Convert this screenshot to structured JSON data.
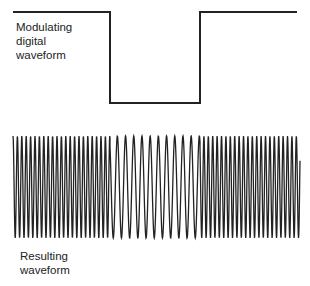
{
  "diagram": {
    "type": "frequency-shift-keying",
    "top_label": [
      "Modulating",
      "digital",
      "waveform"
    ],
    "bottom_label": [
      "Resulting",
      "waveform"
    ],
    "modulating_waveform": {
      "levels": [
        "high",
        "low",
        "high"
      ],
      "segments_x": [
        [
          13,
          110
        ],
        [
          110,
          200
        ],
        [
          200,
          297
        ]
      ],
      "high_y": 12,
      "low_y": 103
    },
    "resulting_waveform": {
      "x_start": 13,
      "x_end": 300,
      "top_y": 136,
      "bottom_y": 238,
      "segments": [
        {
          "x0": 13,
          "x1": 110,
          "period_px": 4.4,
          "frequency": "high"
        },
        {
          "x0": 110,
          "x1": 200,
          "period_px": 8.2,
          "frequency": "low"
        },
        {
          "x0": 200,
          "x1": 300,
          "period_px": 4.4,
          "frequency": "high"
        }
      ]
    },
    "colors": {
      "line": "#222222",
      "background": "#ffffff"
    }
  }
}
